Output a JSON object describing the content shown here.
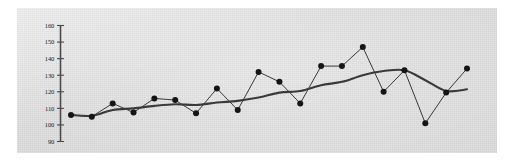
{
  "chart_data": {
    "type": "line",
    "title": "",
    "subtitle": "",
    "xlabel": "",
    "ylabel": "",
    "grid": false,
    "legend_position": "none",
    "ylim": [
      90,
      160
    ],
    "ytick_labels": [
      "160",
      "150",
      "140",
      "130",
      "120",
      "110",
      "100",
      "90"
    ],
    "yticks": [
      160,
      150,
      140,
      130,
      120,
      110,
      100,
      90
    ],
    "xlim": [
      1,
      20
    ],
    "x": [
      1,
      2,
      3,
      4,
      5,
      6,
      7,
      8,
      9,
      10,
      11,
      12,
      13,
      14,
      15,
      16,
      17,
      18,
      19,
      20
    ],
    "xtick_labels": [],
    "series": [
      {
        "name": "observed",
        "style": "markers-with-thin-line",
        "marker": "filled-circle",
        "color": "#151515",
        "values": [
          106,
          105,
          113,
          107.5,
          116,
          115,
          107,
          122,
          109,
          132,
          126,
          113,
          135.5,
          135.5,
          147,
          120,
          133,
          101,
          119.5,
          134
        ]
      },
      {
        "name": "trend",
        "style": "smooth-thick-line",
        "marker": "none",
        "color": "#3a3a3a",
        "values": [
          106,
          105.5,
          109,
          110,
          111.5,
          112.5,
          112,
          113.5,
          114.5,
          116.5,
          119.5,
          120.5,
          124,
          126,
          130,
          132.5,
          133,
          127,
          120.5,
          121.5
        ]
      }
    ],
    "annotations": []
  },
  "figure": {
    "background_color": "#d9d9d9",
    "page_color": "#ffffff",
    "axis_color": "#4a4a4a",
    "marker_color": "#151515",
    "trend_color": "#3a3a3a"
  }
}
